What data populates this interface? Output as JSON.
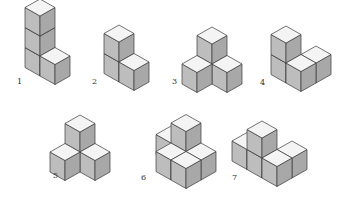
{
  "colors": {
    "top": "#f4f4f4",
    "left": "#bdbdbd",
    "right": "#a8a8a8",
    "edge": "#3a3a3a"
  },
  "figures": [
    {
      "label": "1",
      "cubes": [
        [
          0,
          0,
          0
        ],
        [
          0,
          0,
          1
        ],
        [
          0,
          0,
          2
        ],
        [
          1,
          0,
          0
        ]
      ]
    },
    {
      "label": "2",
      "cubes": [
        [
          0,
          0,
          0
        ],
        [
          0,
          0,
          1
        ],
        [
          1,
          0,
          0
        ]
      ]
    },
    {
      "label": "3",
      "cubes": [
        [
          0,
          0,
          0
        ],
        [
          1,
          0,
          0
        ],
        [
          0,
          1,
          0
        ],
        [
          0,
          0,
          1
        ]
      ]
    },
    {
      "label": "4",
      "cubes": [
        [
          0,
          0,
          0
        ],
        [
          0,
          0,
          1
        ],
        [
          1,
          0,
          0
        ],
        [
          1,
          -1,
          0
        ]
      ]
    },
    {
      "label": "5",
      "cubes": [
        [
          0,
          0,
          0
        ],
        [
          0,
          0,
          1
        ],
        [
          1,
          0,
          0
        ],
        [
          0,
          1,
          0
        ]
      ]
    },
    {
      "label": "6",
      "cubes": [
        [
          0,
          0,
          0
        ],
        [
          1,
          0,
          0
        ],
        [
          0,
          -1,
          0
        ],
        [
          1,
          -1,
          0
        ],
        [
          0,
          -1,
          1
        ],
        [
          -1,
          -1,
          0
        ]
      ]
    },
    {
      "label": "7",
      "cubes": [
        [
          0,
          0,
          0
        ],
        [
          0,
          0,
          1
        ],
        [
          1,
          0,
          0
        ],
        [
          -1,
          0,
          0
        ],
        [
          1,
          -1,
          0
        ]
      ]
    }
  ]
}
